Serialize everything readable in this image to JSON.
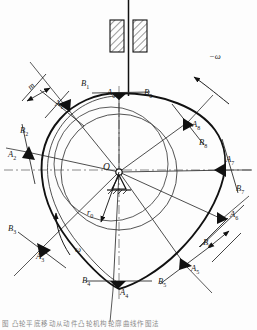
{
  "figure": {
    "center_label": "O",
    "base_radius_label": "r",
    "base_radius_sub": "0",
    "rotation_label": "ω",
    "counter_rotation_label": "−ω",
    "dimension_label": "m",
    "caption": "图  凸轮平底移动从动件凸轮机构轮廓曲线作图法"
  },
  "colors": {
    "profile": "#111111",
    "construction": "#3a3a3a",
    "centerline": "#777777",
    "hatch": "#222222",
    "label": "#1a1a1a"
  },
  "geometry": {
    "center": {
      "x": 119,
      "y": 172
    },
    "base_circle_r": 58,
    "offset_circle_r": 56,
    "offset_circle_cx": 112,
    "offset_circle_cy": 165,
    "profile_r_mean": 78,
    "station_count": 9
  },
  "stations": [
    {
      "id": 0,
      "a_label": "A",
      "a_sub": "0",
      "b_label": "B",
      "b_sub": "0",
      "angle_deg": 90,
      "a_x": 107,
      "a_y": 94,
      "b_x": 140,
      "b_y": 94
    },
    {
      "id": 1,
      "a_label": "A",
      "a_sub": "1",
      "b_label": "B",
      "b_sub": "1",
      "angle_deg": 130,
      "a_x": 60,
      "a_y": 100,
      "b_x": 80,
      "b_y": 84
    },
    {
      "id": 2,
      "a_label": "A",
      "a_sub": "2",
      "b_label": "B",
      "b_sub": "2",
      "angle_deg": 180,
      "a_x": 10,
      "a_y": 150,
      "b_x": 22,
      "b_y": 131
    },
    {
      "id": 3,
      "a_label": "A",
      "a_sub": "3",
      "b_label": "B",
      "b_sub": "3",
      "angle_deg": 222,
      "a_x": 36,
      "a_y": 255,
      "b_x": 10,
      "b_y": 228
    },
    {
      "id": 4,
      "a_label": "A",
      "a_sub": "4",
      "b_label": "B",
      "b_sub": "4",
      "angle_deg": 268,
      "a_x": 120,
      "a_y": 288,
      "b_x": 85,
      "b_y": 275
    },
    {
      "id": 5,
      "a_label": "A",
      "a_sub": "5",
      "b_label": "B",
      "b_sub": "5",
      "angle_deg": 310,
      "a_x": 192,
      "a_y": 267,
      "b_x": 160,
      "b_y": 279
    },
    {
      "id": 6,
      "a_label": "A",
      "a_sub": "6",
      "b_label": "B",
      "b_sub": "6",
      "angle_deg": 338,
      "a_x": 231,
      "a_y": 213,
      "b_x": 208,
      "b_y": 242
    },
    {
      "id": 7,
      "a_label": "A",
      "a_sub": "7",
      "b_label": "B",
      "b_sub": "7",
      "angle_deg": 0,
      "a_x": 228,
      "a_y": 158,
      "b_x": 238,
      "b_y": 188
    },
    {
      "id": 8,
      "a_label": "A",
      "a_sub": "8",
      "b_label": "B",
      "b_sub": "8",
      "angle_deg": 45,
      "a_x": 192,
      "a_y": 124,
      "b_x": 200,
      "b_y": 141
    }
  ],
  "frame": {
    "shaft_label": "shaft",
    "block_left": {
      "x": 110,
      "y": 20,
      "w": 14,
      "h": 32
    },
    "block_right": {
      "x": 133,
      "y": 20,
      "w": 14,
      "h": 32
    }
  }
}
